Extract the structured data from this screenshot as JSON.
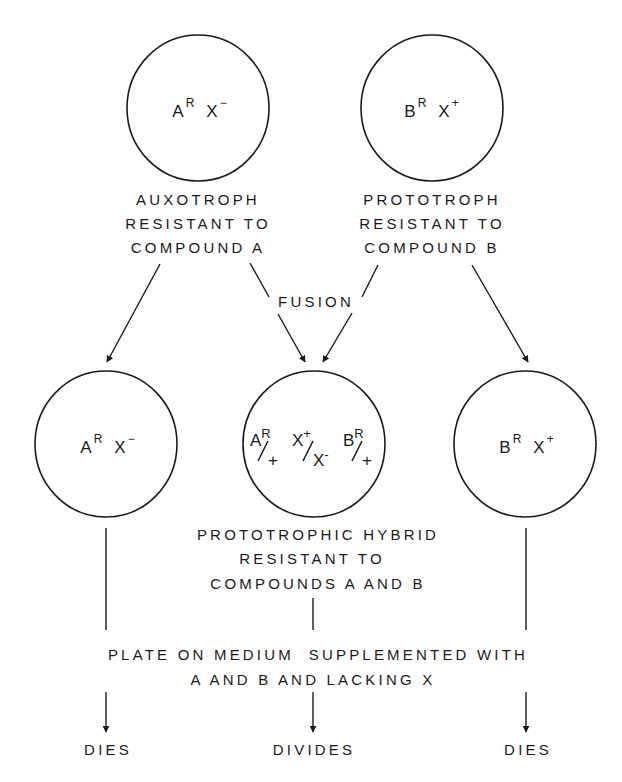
{
  "diagram": {
    "type": "cell-fusion-selection-flowchart",
    "colors": {
      "ink": "#1a1a1a",
      "background": "#ffffff"
    },
    "parents": [
      {
        "id": "parent-a",
        "genotype": {
          "gene1": "A",
          "gene1_sup": "R",
          "gene2": "X",
          "gene2_sup": "−"
        },
        "label_lines": [
          "AUXOTROPH",
          "RESISTANT TO",
          "COMPOUND A"
        ]
      },
      {
        "id": "parent-b",
        "genotype": {
          "gene1": "B",
          "gene1_sup": "R",
          "gene2": "X",
          "gene2_sup": "+"
        },
        "label_lines": [
          "PROTOTROPH",
          "RESISTANT TO",
          "COMPOUND B"
        ]
      }
    ],
    "fusion_label": "FUSION",
    "progeny": [
      {
        "id": "unfused-a",
        "genotype": {
          "gene1": "A",
          "gene1_sup": "R",
          "gene2": "X",
          "gene2_sup": "−"
        },
        "outcome": "DIES"
      },
      {
        "id": "hybrid",
        "genotype_fractions": [
          {
            "top": "A",
            "top_sup": "R",
            "bottom": "+",
            "bottom_sup": ""
          },
          {
            "top": "X",
            "top_sup": "+",
            "bottom": "X",
            "bottom_sup": "-"
          },
          {
            "top": "B",
            "top_sup": "R",
            "bottom": "+",
            "bottom_sup": ""
          }
        ],
        "label_lines": [
          "PROTOTROPHIC HYBRID",
          "RESISTANT TO",
          "COMPOUNDS A AND B"
        ],
        "outcome": "DIVIDES"
      },
      {
        "id": "unfused-b",
        "genotype": {
          "gene1": "B",
          "gene1_sup": "R",
          "gene2": "X",
          "gene2_sup": "+"
        },
        "outcome": "DIES"
      }
    ],
    "selection_step": {
      "lines": [
        "PLATE ON MEDIUM  SUPPLEMENTED WITH",
        "A AND B AND LACKING X"
      ]
    }
  }
}
